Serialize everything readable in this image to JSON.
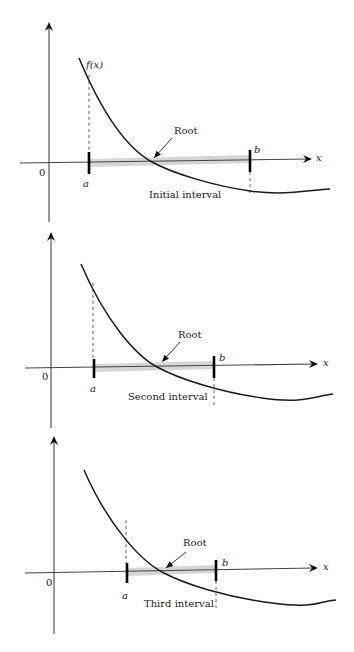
{
  "figure": {
    "colors": {
      "line": "#1a1a1a",
      "axis": "#444444",
      "band": "#cfcfcf",
      "dash": "#555555"
    },
    "panels": [
      {
        "id": "initial",
        "caption": "Initial interval",
        "function_label": "f(x)",
        "root_label": "Root",
        "a_label": "a",
        "b_label": "b",
        "origin_label": "0",
        "x_axis_label": "x",
        "geom": {
          "yaxis": {
            "x": 49,
            "top": 22,
            "bottom": 222
          },
          "xaxis": {
            "x1": 20,
            "y1": 163,
            "x2": 312,
            "y2": 159
          },
          "curve": "M 79 58 C 105 120, 130 150, 152 162 S 215 186, 250 191 S 310 190, 330 189",
          "a_tick": {
            "x": 89,
            "y1": 152,
            "y2": 174
          },
          "b_tick": {
            "x": 250,
            "y1": 150,
            "y2": 172
          },
          "a_dash": {
            "x": 89,
            "y1": 75,
            "y2": 152
          },
          "b_dash": {
            "x": 250,
            "y1": 172,
            "y2": 196
          },
          "band": {
            "x1": 90,
            "x2": 250,
            "y_left": 163,
            "y_right": 159,
            "h": 8
          },
          "root_arrow": {
            "x1": 172,
            "y1": 138,
            "x2": 154,
            "y2": 158
          },
          "labels": {
            "fx": {
              "x": 86,
              "y": 60
            },
            "root": {
              "x": 174,
              "y": 126
            },
            "a": {
              "x": 83,
              "y": 179
            },
            "b": {
              "x": 254,
              "y": 145
            },
            "origin": {
              "x": 39,
              "y": 168
            },
            "x": {
              "x": 316,
              "y": 153
            },
            "caption": {
              "x": 149,
              "y": 190
            }
          }
        }
      },
      {
        "id": "second",
        "caption": "Second interval",
        "root_label": "Root",
        "a_label": "a",
        "b_label": "b",
        "origin_label": "0",
        "x_axis_label": "x",
        "geom": {
          "yaxis": {
            "x": 51,
            "top": 232,
            "bottom": 428
          },
          "xaxis": {
            "x1": 25,
            "y1": 368,
            "x2": 318,
            "y2": 364
          },
          "curve": "M 81 264 C 105 320, 135 355, 157 367 S 220 392, 262 398 S 315 396, 333 394",
          "a_tick": {
            "x": 94,
            "y1": 359,
            "y2": 378
          },
          "b_tick": {
            "x": 214,
            "y1": 356,
            "y2": 378
          },
          "a_dash": {
            "x": 93,
            "y1": 283,
            "y2": 359
          },
          "b_dash": {
            "x": 214,
            "y1": 378,
            "y2": 406
          },
          "band": {
            "x1": 95,
            "x2": 213,
            "y_left": 368,
            "y_right": 365,
            "h": 8
          },
          "root_arrow": {
            "x1": 180,
            "y1": 342,
            "x2": 162,
            "y2": 362
          },
          "labels": {
            "root": {
              "x": 178,
              "y": 330
            },
            "a": {
              "x": 90,
              "y": 384
            },
            "b": {
              "x": 219,
              "y": 353
            },
            "origin": {
              "x": 42,
              "y": 372
            },
            "x": {
              "x": 323,
              "y": 358
            },
            "caption": {
              "x": 128,
              "y": 392
            }
          }
        }
      },
      {
        "id": "third",
        "caption": "Third interval",
        "root_label": "Root",
        "a_label": "a",
        "b_label": "b",
        "origin_label": "0",
        "x_axis_label": "x",
        "geom": {
          "yaxis": {
            "x": 54,
            "top": 436,
            "bottom": 634
          },
          "xaxis": {
            "x1": 25,
            "y1": 573,
            "x2": 318,
            "y2": 568
          },
          "curve": "M 84 470 C 108 525, 140 560, 162 572 S 225 597, 272 603 S 318 601, 336 600",
          "a_tick": {
            "x": 127,
            "y1": 563,
            "y2": 583
          },
          "b_tick": {
            "x": 216,
            "y1": 560,
            "y2": 581
          },
          "a_dash": {
            "x": 126,
            "y1": 520,
            "y2": 563
          },
          "b_dash": {
            "x": 216,
            "y1": 581,
            "y2": 610
          },
          "band": {
            "x1": 128,
            "x2": 215,
            "y_left": 572,
            "y_right": 569,
            "h": 8
          },
          "root_arrow": {
            "x1": 186,
            "y1": 552,
            "x2": 166,
            "y2": 568
          },
          "labels": {
            "root": {
              "x": 183,
              "y": 538
            },
            "a": {
              "x": 122,
              "y": 591
            },
            "b": {
              "x": 222,
              "y": 558
            },
            "origin": {
              "x": 46,
              "y": 578
            },
            "x": {
              "x": 323,
              "y": 562
            },
            "caption": {
              "x": 144,
              "y": 599
            }
          }
        }
      }
    ]
  }
}
